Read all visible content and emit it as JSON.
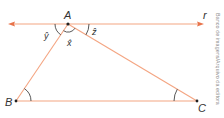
{
  "diagram": {
    "title": "",
    "colors": {
      "line": "#f4a582",
      "arrow": "#e8734a",
      "arc": "#444444",
      "point": "#222222",
      "label": "#333333"
    },
    "line_r": {
      "label": "r",
      "x1": 9,
      "y": 24,
      "x2": 203
    },
    "points": {
      "A": {
        "label": "A",
        "x": 68,
        "y": 24
      },
      "B": {
        "label": "B",
        "x": 16,
        "y": 101
      },
      "C": {
        "label": "C",
        "x": 197,
        "y": 101
      }
    },
    "angles": {
      "x": {
        "label": "x̂",
        "description": "angle BAC at vertex A"
      },
      "y": {
        "label": "ŷ",
        "description": "angle between line r (left) and segment AB"
      },
      "z": {
        "label": "ẑ",
        "description": "angle between line r (right) and segment AC"
      }
    },
    "credit": "Banco de imagens/Arquivo da editora"
  }
}
